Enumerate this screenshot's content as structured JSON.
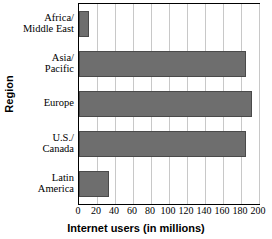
{
  "chart_data": {
    "type": "bar",
    "orientation": "horizontal",
    "title": "",
    "xlabel": "Internet users (in millions)",
    "ylabel": "Region",
    "categories": [
      "Africa/ Middle East",
      "Asia/ Pacific",
      "Europe",
      "U.S./ Canada",
      "Latin America"
    ],
    "category_lines": [
      [
        "Africa/",
        "Middle East"
      ],
      [
        "Asia/",
        "Pacific"
      ],
      [
        "Europe"
      ],
      [
        "U.S./",
        "Canada"
      ],
      [
        "Latin",
        "America"
      ]
    ],
    "values": [
      11,
      186,
      192,
      186,
      33
    ],
    "xlim": [
      0,
      200
    ],
    "xticks": [
      0,
      20,
      40,
      60,
      80,
      100,
      120,
      140,
      160,
      180,
      200
    ],
    "xtick_labels": [
      "0",
      "20",
      "40",
      "60",
      "80",
      "100",
      "120",
      "140",
      "160",
      "180",
      "200"
    ],
    "grid": "vertical",
    "legend": "none",
    "bar_color": "#6e6e6e",
    "grid_color": "#c8c8c8",
    "axis_color": "#000000",
    "background_color": "#ffffff"
  }
}
